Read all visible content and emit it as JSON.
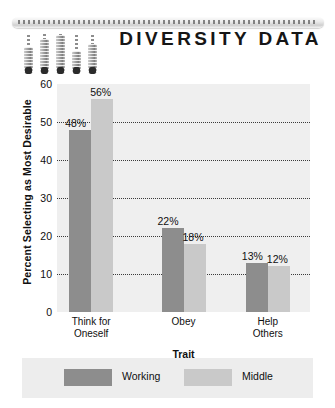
{
  "document": {
    "title": "DIVERSITY DATA"
  },
  "decor": {
    "ruler_name": "ruler-bar",
    "thermometers": [
      {
        "height": 26,
        "stem": 12
      },
      {
        "height": 34,
        "stem": 5
      },
      {
        "height": 38,
        "stem": 1
      },
      {
        "height": 22,
        "stem": 16
      },
      {
        "height": 29,
        "stem": 9
      }
    ]
  },
  "chart_data": {
    "type": "bar",
    "title": "",
    "xlabel": "Trait",
    "ylabel": "Percent Selecting as Most Desirable",
    "categories": [
      "Think for Oneself",
      "Obey",
      "Help Others"
    ],
    "category_lines": [
      [
        "Think for",
        "Oneself"
      ],
      [
        "Obey"
      ],
      [
        "Help",
        "Others"
      ]
    ],
    "series": [
      {
        "name": "Working",
        "color": "#8d8d8d",
        "values": [
          48,
          22,
          13
        ],
        "labels": [
          "48%",
          "22%",
          "13%"
        ]
      },
      {
        "name": "Middle",
        "color": "#c9c9c9",
        "values": [
          56,
          18,
          12
        ],
        "labels": [
          "56%",
          "18%",
          "12%"
        ]
      }
    ],
    "ylim": [
      0,
      60
    ],
    "yticks": [
      0,
      10,
      20,
      30,
      40,
      50,
      60
    ],
    "ytick_labels": [
      "0",
      "10",
      "20",
      "30",
      "40",
      "50",
      "60"
    ],
    "grid": "horizontal-dotted",
    "legend_position": "bottom",
    "plot_background": "#efefef"
  }
}
